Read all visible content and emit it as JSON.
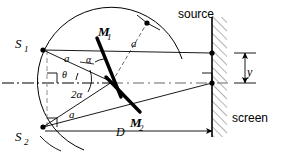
{
  "figure": {
    "background_color": "#ffffff",
    "stroke_color": "#000000",
    "dash_color": "#808080",
    "hatch_color": "#8a8a8a",
    "width": 282,
    "height": 157
  },
  "labels": {
    "source": "source",
    "screen": "screen",
    "mirror_1": "M",
    "mirror_1_sub": "1",
    "mirror_2": "M",
    "mirror_2_sub": "2",
    "slit_1": "S",
    "slit_1_sub": "1",
    "slit_2": "S",
    "slit_2_sub": "2",
    "radius_top": "a",
    "radius_upper_left": "a",
    "radius_lower_left": "a",
    "angle_alpha": "α",
    "angle_two_alpha": "2α",
    "angle_theta": "θ",
    "distance_d": "D",
    "offset_y": "y"
  },
  "geometry": {
    "vertex": {
      "x": 112,
      "y": 82
    },
    "arc_radius": 74,
    "source_point": {
      "x": 147,
      "y": 23
    },
    "slit_1_point": {
      "x": 43,
      "y": 50
    },
    "slit_2_point": {
      "x": 43,
      "y": 127
    },
    "screen_x": 212,
    "screen_top": 17,
    "screen_bottom": 137,
    "screen_thickness": 15,
    "screen_hit_upper": {
      "x": 212,
      "y": 53
    },
    "screen_hit_lower": {
      "x": 212,
      "y": 83
    },
    "mirror_1_from": {
      "x": 97,
      "y": 38
    },
    "mirror_1_to": {
      "x": 121,
      "y": 97
    },
    "mirror_2_from": {
      "x": 108,
      "y": 79
    },
    "mirror_2_to": {
      "x": 140,
      "y": 112
    },
    "axis_y": 83,
    "dimension_d_y": 131,
    "dimension_d_from": 45,
    "dimension_d_to": 212,
    "offset_y_x": 245,
    "offset_y_top": 53,
    "offset_y_bottom": 83
  },
  "label_positions": {
    "source": {
      "x": 178,
      "y": 18
    },
    "screen": {
      "x": 232,
      "y": 122
    },
    "mirror_1": {
      "x": 98,
      "y": 34
    },
    "mirror_2": {
      "x": 133,
      "y": 126
    },
    "slit_1": {
      "x": 18,
      "y": 47
    },
    "slit_2": {
      "x": 18,
      "y": 139
    },
    "radius_top": {
      "x": 133,
      "y": 45
    },
    "radius_upper_left": {
      "x": 66,
      "y": 60
    },
    "radius_lower_left": {
      "x": 71,
      "y": 116
    },
    "angle_alpha": {
      "x": 88,
      "y": 60
    },
    "angle_two_alpha": {
      "x": 74,
      "y": 96
    },
    "angle_theta": {
      "x": 64,
      "y": 76
    },
    "distance_d": {
      "x": 119,
      "y": 135
    },
    "offset_y": {
      "x": 248,
      "y": 74
    }
  }
}
